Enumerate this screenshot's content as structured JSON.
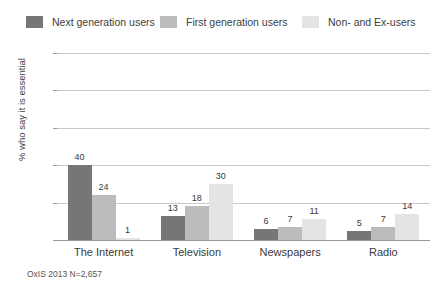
{
  "chart_data": {
    "type": "bar",
    "title": "",
    "xlabel": "",
    "ylabel": "% who say it is essential",
    "ylim": [
      0,
      100
    ],
    "yticks": [
      0,
      20,
      40,
      60,
      80,
      100
    ],
    "grid": true,
    "legend_position": "top",
    "categories": [
      "The Internet",
      "Television",
      "Newspapers",
      "Radio"
    ],
    "series": [
      {
        "name": "Next generation users",
        "color": "#767676",
        "values": [
          40,
          13,
          6,
          5
        ]
      },
      {
        "name": "First generation users",
        "color": "#bcbcbc",
        "values": [
          24,
          18,
          7,
          7
        ]
      },
      {
        "name": "Non- and Ex-users",
        "color": "#e4e4e4",
        "values": [
          1,
          30,
          11,
          14
        ]
      }
    ],
    "source_note": "OxIS 2013 N=2,657"
  },
  "legend": {
    "items": [
      {
        "label": "Next generation users",
        "color": "#767676"
      },
      {
        "label": "First generation users",
        "color": "#bcbcbc"
      },
      {
        "label": "Non- and Ex-users",
        "color": "#e4e4e4"
      }
    ]
  },
  "axis": {
    "y_title": "% who say it is essential",
    "y_ticks": [
      "0",
      "20",
      "40",
      "60",
      "80",
      "100"
    ]
  },
  "footer": {
    "source": "OxIS 2013 N=2,657"
  },
  "colors": {
    "gridline": "#c9c9c9",
    "axis": "#9a9a9a",
    "text": "#3a3a3a",
    "background": "#ffffff"
  }
}
